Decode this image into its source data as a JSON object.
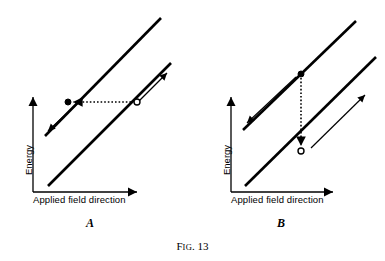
{
  "figure": {
    "caption_prefix": "F",
    "caption_smallcaps": "IG",
    "caption_suffix": ". 13",
    "caption_full": "Fig. 13",
    "line_color": "#000000",
    "background_color": "#ffffff"
  },
  "panels": [
    {
      "label": "A",
      "axis": {
        "x_label": "Applied field direction",
        "y_label": "Energy"
      },
      "description": "Two parallel energy bands with a horizontal dotted transition arrow pointing left, from an open circle on the lower band to a filled circle on the upper band",
      "markers": {
        "filled_dot": "filled-state-marker",
        "open_dot": "open-state-marker"
      },
      "transition": {
        "direction": "horizontal-left",
        "style": "dotted"
      },
      "band_arrows": [
        "down-left-arrow-upper-band",
        "up-right-arrow-lower-band"
      ]
    },
    {
      "label": "B",
      "axis": {
        "x_label": "Applied field direction",
        "y_label": "Energy"
      },
      "description": "Two parallel energy bands with a vertical dotted transition arrow pointing down, from a filled circle on the upper band to an open circle on the lower band",
      "markers": {
        "filled_dot": "filled-state-marker",
        "open_dot": "open-state-marker"
      },
      "transition": {
        "direction": "vertical-down",
        "style": "dotted"
      },
      "band_arrows": [
        "down-left-arrow-upper-band",
        "up-right-arrow-lower-band"
      ]
    }
  ]
}
